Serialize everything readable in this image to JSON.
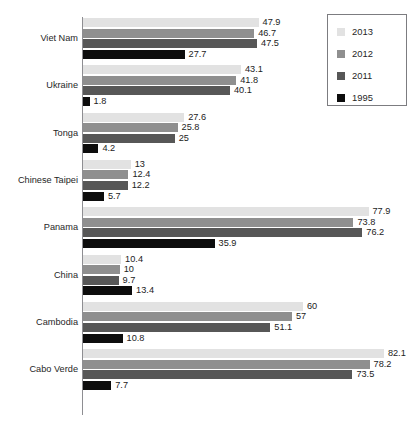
{
  "chart_data": {
    "type": "bar",
    "orientation": "horizontal",
    "title": "",
    "xlabel": "",
    "ylabel": "",
    "grid": false,
    "xlim": [
      0,
      88
    ],
    "legend_position": "top-right",
    "categories": [
      "Viet Nam",
      "Ukraine",
      "Tonga",
      "Chinese Taipei",
      "Panama",
      "China",
      "Cambodia",
      "Cabo Verde"
    ],
    "series": [
      {
        "name": "2013",
        "color": "#e2e2e2",
        "values": [
          47.9,
          43.1,
          27.6,
          13,
          77.9,
          10.4,
          60,
          82.1
        ]
      },
      {
        "name": "2012",
        "color": "#8f8f8f",
        "values": [
          46.7,
          41.8,
          25.8,
          12.4,
          73.8,
          10,
          57,
          78.2
        ]
      },
      {
        "name": "2011",
        "color": "#575757",
        "values": [
          47.5,
          40.1,
          25,
          12.2,
          76.2,
          9.7,
          51.1,
          73.5
        ]
      },
      {
        "name": "1995",
        "color": "#0d0d0d",
        "values": [
          27.7,
          1.8,
          4.2,
          5.7,
          35.9,
          13.4,
          10.8,
          7.7
        ]
      }
    ],
    "value_labels": {
      "Viet Nam": [
        "47.9",
        "46.7",
        "47.5",
        "27.7"
      ],
      "Ukraine": [
        "43.1",
        "41.8",
        "40.1",
        "1.8"
      ],
      "Tonga": [
        "27.6",
        "25.8",
        "25",
        "4.2"
      ],
      "Chinese Taipei": [
        "13",
        "12.4",
        "12.2",
        "5.7"
      ],
      "Panama": [
        "77.9",
        "73.8",
        "76.2",
        "35.9"
      ],
      "China": [
        "10.4",
        "10",
        "9.7",
        "13.4"
      ],
      "Cambodia": [
        "60",
        "57",
        "51.1",
        "10.8"
      ],
      "Cabo Verde": [
        "82.1",
        "78.2",
        "73.5",
        "7.7"
      ]
    }
  },
  "legend": {
    "entries": [
      {
        "label": "2013",
        "color": "#e2e2e2"
      },
      {
        "label": "2012",
        "color": "#8f8f8f"
      },
      {
        "label": "2011",
        "color": "#575757"
      },
      {
        "label": "1995",
        "color": "#0d0d0d"
      }
    ]
  }
}
